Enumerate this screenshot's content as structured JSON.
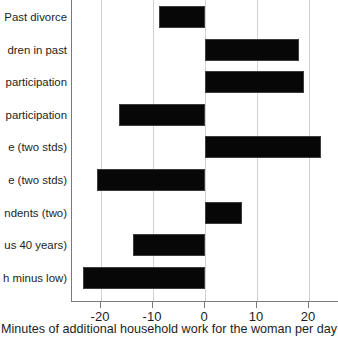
{
  "chart_data": {
    "type": "bar",
    "orientation": "horizontal",
    "title": "",
    "xlabel": "Minutes of additional household work for the woman per day",
    "ylabel": "",
    "xlim": [
      -25.4,
      26.0
    ],
    "xticks": [
      -20,
      -10,
      0,
      10,
      20
    ],
    "xtick_labels": [
      "-20",
      "-10",
      "0",
      "10",
      "20"
    ],
    "grid": true,
    "grid_axis": "x",
    "legend": false,
    "bar_color": "#070707",
    "categories": [
      "Past divorce",
      "dren in past",
      "participation",
      "participation",
      "e (two stds)",
      "e (two stds)",
      "ndents (two)",
      "us 40 years)",
      "h minus low)"
    ],
    "values": [
      -8.8,
      18.1,
      19.0,
      -16.5,
      22.3,
      -20.8,
      7.1,
      -13.8,
      -23.5
    ]
  },
  "axis": {
    "tick_labels": [
      "-20",
      "-10",
      "0",
      "10",
      "20"
    ],
    "title": "Minutes of additional household work for the woman per day"
  },
  "labels": {
    "items": [
      "Past divorce",
      "dren in past",
      "participation",
      "participation",
      "e (two stds)",
      "e (two stds)",
      "ndents (two)",
      "us 40 years)",
      "h minus low)"
    ]
  }
}
